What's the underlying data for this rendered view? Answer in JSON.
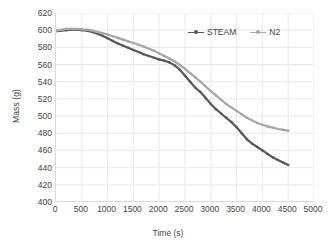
{
  "chart_data": {
    "type": "line",
    "title": "",
    "xlabel": "Time (s)",
    "ylabel": "Mass (g)",
    "xlim": [
      0,
      5000
    ],
    "ylim": [
      400,
      620
    ],
    "xticks": [
      0,
      500,
      1000,
      1500,
      2000,
      2500,
      3000,
      3500,
      4000,
      4500,
      5000
    ],
    "yticks": [
      400,
      420,
      440,
      460,
      480,
      500,
      520,
      540,
      560,
      580,
      600,
      620
    ],
    "grid": "both-light",
    "legend_position": "top-center",
    "series": [
      {
        "name": "STEAM",
        "color": "#595959",
        "x": [
          0,
          100,
          200,
          300,
          400,
          500,
          600,
          700,
          800,
          900,
          1000,
          1100,
          1200,
          1300,
          1400,
          1500,
          1600,
          1700,
          1800,
          1900,
          2000,
          2100,
          2200,
          2300,
          2400,
          2500,
          2600,
          2700,
          2800,
          2900,
          3000,
          3100,
          3200,
          3300,
          3400,
          3500,
          3600,
          3700,
          3800,
          3900,
          4000,
          4100,
          4200,
          4300,
          4400,
          4500
        ],
        "values": [
          599,
          599.5,
          600,
          600.5,
          600.5,
          600,
          599.5,
          598,
          596,
          593.5,
          590.5,
          587.5,
          584.5,
          582,
          579.5,
          577,
          574.5,
          572,
          570,
          568,
          566,
          564.5,
          562.5,
          559,
          554,
          547,
          540,
          533,
          528,
          521,
          514,
          508,
          503,
          498,
          493,
          487,
          480,
          473,
          468,
          464,
          460,
          456,
          452,
          449,
          446,
          443
        ]
      },
      {
        "name": "N2",
        "color": "#a6a6a6",
        "x": [
          0,
          100,
          200,
          300,
          400,
          500,
          600,
          700,
          800,
          900,
          1000,
          1100,
          1200,
          1300,
          1400,
          1500,
          1600,
          1700,
          1800,
          1900,
          2000,
          2100,
          2200,
          2300,
          2400,
          2500,
          2600,
          2700,
          2800,
          2900,
          3000,
          3100,
          3200,
          3300,
          3400,
          3500,
          3600,
          3700,
          3800,
          3900,
          4000,
          4100,
          4200,
          4300,
          4400,
          4500
        ],
        "values": [
          599.5,
          600.5,
          601.5,
          601.5,
          601.5,
          601,
          600.5,
          599.5,
          598,
          596.5,
          595,
          593,
          591,
          589,
          587,
          585,
          583,
          581,
          578.5,
          576,
          573,
          570,
          567,
          563.5,
          559.5,
          555,
          550,
          545,
          540,
          534.5,
          529,
          524,
          519,
          514,
          510,
          506,
          502,
          498,
          495,
          492,
          490,
          488,
          486.5,
          485,
          484,
          483
        ]
      }
    ]
  },
  "legend": {
    "items": [
      {
        "label": "STEAM"
      },
      {
        "label": "N2"
      }
    ]
  },
  "axes": {
    "x_title": "Time (s)",
    "y_title": "Mass (g)"
  },
  "colors": {
    "steam": "#595959",
    "n2": "#a6a6a6",
    "grid": "#e8e8e8",
    "axis": "#d9d9d9",
    "text": "#3f3f3f",
    "background": "#ffffff"
  }
}
